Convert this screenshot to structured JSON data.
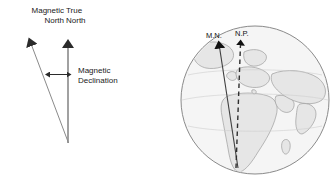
{
  "figure": {
    "background_color": "#ffffff",
    "width": 333,
    "height": 191
  },
  "left_diagram": {
    "name": "declination-angle-diagram",
    "labels": {
      "magnetic_north": "Magnetic\nNorth",
      "true_north": "True\nNorth",
      "magnetic_declination": "Magnetic\nDeclination"
    },
    "vertex": {
      "x": 68,
      "y": 142
    },
    "true_north_line": {
      "x1": 68,
      "y1": 142,
      "x2": 68,
      "y2": 40
    },
    "magnetic_north_line": {
      "x1": 68,
      "y1": 142,
      "x2": 30,
      "y2": 40
    },
    "declination_arrow": {
      "x1": 50,
      "y1": 74,
      "x2": 68,
      "y2": 74
    },
    "line_color": "#6b6b6b",
    "arrow_color": "#2b2b2b"
  },
  "right_diagram": {
    "name": "globe-diagram",
    "globe": {
      "center_x": 255,
      "center_y": 100,
      "radius": 74,
      "fill_color": "#f4f4f4",
      "outline_color": "#7a7a7a",
      "land_fill": "#e4e4e4",
      "land_outline": "#9a9a9a"
    },
    "labels": {
      "magnetic_north_abbrev": "M.N.",
      "north_pole_abbrev": "N.P."
    },
    "magnetic_axis": {
      "style": "solid",
      "x1": 238,
      "y1": 168,
      "x2": 218,
      "y2": 46,
      "color": "#4a4a4a"
    },
    "rotation_axis": {
      "style": "dashed",
      "x1": 236,
      "y1": 168,
      "x2": 241,
      "y2": 42,
      "color": "#3a3a3a"
    }
  }
}
